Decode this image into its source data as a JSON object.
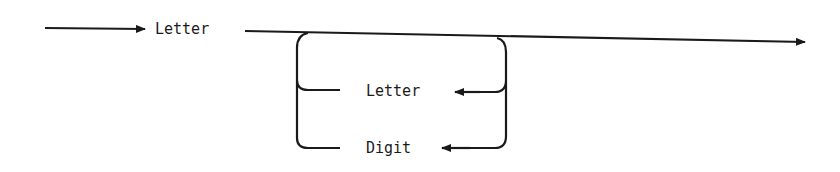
{
  "diagram": {
    "type": "syntax-diagram",
    "start_label": "Letter",
    "loop_items": [
      {
        "label": "Letter"
      },
      {
        "label": "Digit"
      }
    ],
    "stroke_color": "#1a1a1a"
  }
}
